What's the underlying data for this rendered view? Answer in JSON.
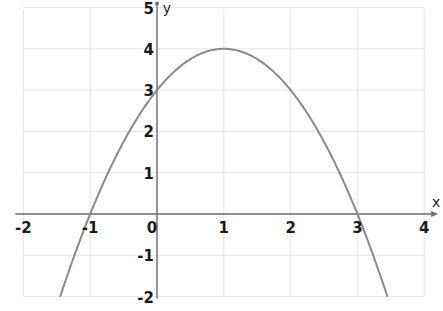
{
  "chart_data": {
    "type": "line",
    "title": "",
    "xlabel": "x",
    "ylabel": "y",
    "xlim": [
      -2,
      4
    ],
    "ylim": [
      -2,
      5
    ],
    "grid": true,
    "x_ticks": [
      "-2",
      "-1",
      "0",
      "1",
      "2",
      "3",
      "4"
    ],
    "y_ticks": [
      "-2",
      "-1",
      "1",
      "2",
      "3",
      "4",
      "5"
    ],
    "origin_label": "0",
    "series": [
      {
        "name": "y = -x^2 + 2x + 3",
        "x": [
          -1.45,
          -1,
          -0.5,
          0,
          0.5,
          1,
          1.5,
          2,
          2.5,
          3,
          3.45
        ],
        "y": [
          -2.0,
          0,
          1.75,
          3,
          3.75,
          4,
          3.75,
          3,
          1.75,
          0,
          -2.0
        ]
      }
    ],
    "annotations": {
      "vertex": [
        1,
        4
      ],
      "x_intercepts": [
        -1,
        3
      ],
      "y_intercept": 3
    }
  },
  "colors": {
    "curve": "#8a8a8a",
    "axis": "#6e6e6e",
    "grid": "#e6e6e6",
    "text": "#1a1a1a",
    "background": "#ffffff"
  }
}
